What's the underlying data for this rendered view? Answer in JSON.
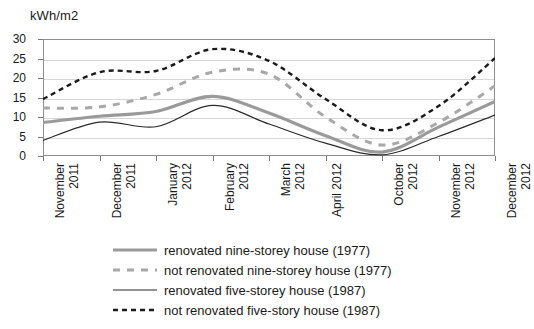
{
  "chart_data": {
    "type": "line",
    "title": "",
    "ylabel": "kWh/m2",
    "xlabel": "",
    "ylim": [
      0,
      30
    ],
    "yticks": [
      0,
      5,
      10,
      15,
      20,
      25,
      30
    ],
    "grid": true,
    "legend_position": "bottom",
    "categories": [
      "November\n2011",
      "December\n2011",
      "January\n2012",
      "February\n2012",
      "March\n2012",
      "April 2012",
      "October\n2012",
      "November\n2012",
      "December\n2012"
    ],
    "series": [
      {
        "name": "renovated nine-storey house (1977)",
        "style": "solid",
        "color": "#9a9a9a",
        "width": 3.2,
        "values": [
          8.6,
          10.2,
          11.4,
          15.3,
          11.0,
          5.2,
          1.0,
          7.4,
          14.0
        ]
      },
      {
        "name": "not renovated nine-storey house (1977)",
        "style": "dashed",
        "color": "#a8a8a8",
        "width": 3.0,
        "values": [
          12.3,
          12.6,
          15.8,
          21.5,
          21.0,
          10.0,
          2.8,
          8.6,
          18.0
        ]
      },
      {
        "name": "renovated five-storey house (1987)",
        "style": "solid",
        "color": "#2b2b2b",
        "width": 1.2,
        "values": [
          4.0,
          8.7,
          7.5,
          13.0,
          8.2,
          3.3,
          0.3,
          5.0,
          10.5
        ]
      },
      {
        "name": "not renovated five-story house (1987)",
        "style": "dashed",
        "color": "#1a1a1a",
        "width": 2.4,
        "values": [
          14.6,
          21.5,
          21.8,
          27.4,
          24.4,
          14.6,
          6.6,
          12.8,
          25.1
        ]
      }
    ]
  },
  "legend": {
    "items": [
      {
        "label": "renovated nine-storey house (1977)"
      },
      {
        "label": "not renovated nine-storey house (1977)"
      },
      {
        "label": "renovated five-storey house (1987)"
      },
      {
        "label": "not renovated five-story house (1987)"
      }
    ]
  }
}
